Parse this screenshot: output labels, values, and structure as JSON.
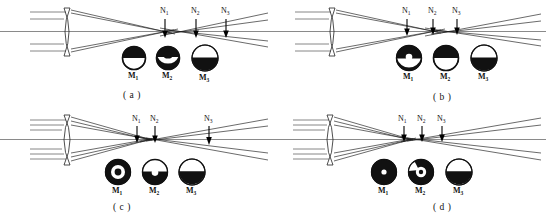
{
  "figure": {
    "panel_count": 4,
    "plane_labels": [
      "N",
      "N",
      "N"
    ],
    "plane_label_base": "N",
    "spot_label_base": "M",
    "colors": {
      "ink": "#111111",
      "ray": "#1a1a1a",
      "axis": "#3a3a3a",
      "paper": "#ffffff"
    }
  },
  "panels": [
    {
      "id": "a",
      "caption": "( a )",
      "planes": [
        {
          "label": "N",
          "sub": "1"
        },
        {
          "label": "N",
          "sub": "2"
        },
        {
          "label": "N",
          "sub": "3"
        }
      ],
      "spots": [
        {
          "label": "M",
          "sub": "1",
          "pattern": "top-dark-half"
        },
        {
          "label": "M",
          "sub": "2",
          "pattern": "dark-with-light-band"
        },
        {
          "label": "M",
          "sub": "3",
          "pattern": "bottom-dark-half"
        }
      ]
    },
    {
      "id": "b",
      "caption": "( b )",
      "planes": [
        {
          "label": "N",
          "sub": "1"
        },
        {
          "label": "N",
          "sub": "2"
        },
        {
          "label": "N",
          "sub": "3"
        }
      ],
      "spots": [
        {
          "label": "M",
          "sub": "1",
          "pattern": "dark-with-light-center"
        },
        {
          "label": "M",
          "sub": "2",
          "pattern": "top-dark-half"
        },
        {
          "label": "M",
          "sub": "3",
          "pattern": "bottom-dark-half"
        }
      ]
    },
    {
      "id": "c",
      "caption": "( c )",
      "planes": [
        {
          "label": "N",
          "sub": "1"
        },
        {
          "label": "N",
          "sub": "2"
        },
        {
          "label": "N",
          "sub": "3"
        }
      ],
      "spots": [
        {
          "label": "M",
          "sub": "1",
          "pattern": "dark-ring-light-gap-dark-core"
        },
        {
          "label": "M",
          "sub": "2",
          "pattern": "dark-with-light-center"
        },
        {
          "label": "M",
          "sub": "3",
          "pattern": "bottom-dark-half"
        }
      ]
    },
    {
      "id": "d",
      "caption": "( d )",
      "planes": [
        {
          "label": "N",
          "sub": "1"
        },
        {
          "label": "N",
          "sub": "2"
        },
        {
          "label": "N",
          "sub": "3"
        }
      ],
      "spots": [
        {
          "label": "M",
          "sub": "1",
          "pattern": "dark-with-small-light-core"
        },
        {
          "label": "M",
          "sub": "2",
          "pattern": "dark-ring-light-center"
        },
        {
          "label": "M",
          "sub": "3",
          "pattern": "bottom-dark-half"
        }
      ]
    }
  ]
}
